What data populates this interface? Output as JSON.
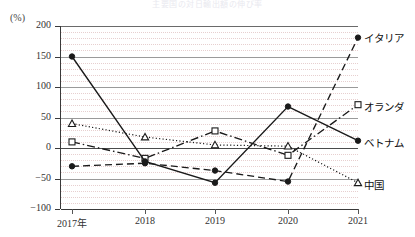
{
  "title": "主要国の対日輸出額の伸び率",
  "axis": {
    "unit_label": "(%)",
    "y_ticks": [
      "200",
      "150",
      "100",
      "50",
      "0",
      "−50",
      "−100"
    ],
    "x_ticks": [
      "2017年",
      "2018",
      "2019",
      "2020",
      "2021"
    ]
  },
  "series_labels": {
    "italy": "イタリア",
    "netherlands": "オランダ",
    "vietnam": "ベトナム",
    "china": "中国"
  },
  "chart_data": {
    "type": "line",
    "title": "主要国の対日輸出額の伸び率",
    "xlabel": "",
    "ylabel": "(%)",
    "ylim": [
      -100,
      200
    ],
    "xlim_categories": [
      "2017年",
      "2018",
      "2019",
      "2020",
      "2021"
    ],
    "grid": true,
    "legend_position": "right-inline-labels",
    "categories": [
      "2017年",
      "2018",
      "2019",
      "2020",
      "2021"
    ],
    "series": [
      {
        "name": "イタリア",
        "values": [
          -30,
          -25,
          -37,
          -55,
          181
        ],
        "line_style": "dashed",
        "marker": "filled-circle",
        "color": "#1a1a1a"
      },
      {
        "name": "オランダ",
        "values": [
          10,
          -17,
          28,
          -12,
          71
        ],
        "line_style": "dash-dot",
        "marker": "open-square",
        "color": "#1a1a1a"
      },
      {
        "name": "ベトナム",
        "values": [
          150,
          -22,
          -57,
          68,
          12
        ],
        "line_style": "solid",
        "marker": "filled-circle",
        "color": "#1a1a1a"
      },
      {
        "name": "中国",
        "values": [
          40,
          18,
          5,
          3,
          -57
        ],
        "line_style": "dotted",
        "marker": "open-triangle",
        "color": "#1a1a1a"
      }
    ]
  }
}
